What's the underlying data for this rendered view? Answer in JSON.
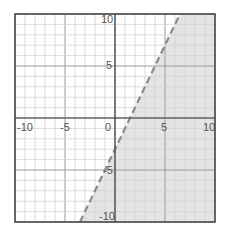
{
  "chart_data": {
    "type": "area",
    "title": "",
    "xlabel": "",
    "ylabel": "",
    "xlim": [
      -10,
      10
    ],
    "ylim": [
      -10,
      10
    ],
    "grid": {
      "minor_step": 1,
      "major_step": 5
    },
    "x_tick_labels": [
      "-10",
      "-5",
      "0",
      "5",
      "10"
    ],
    "y_tick_labels": [
      "10",
      "5",
      "-5",
      "-10"
    ],
    "boundary_line": {
      "equation": "y = 2x - 3",
      "slope": 2,
      "intercept": -3,
      "style": "dashed"
    },
    "shaded_region": "y < 2x - 3",
    "shade_color": "#e4e4e4",
    "line_color": "#8a8a8a"
  },
  "labels": {
    "xm10": "-10",
    "xm5": "-5",
    "x0": "0",
    "x5": "5",
    "x10": "10",
    "y10": "10",
    "y5": "5",
    "ym5": "-5",
    "ym10": "-10"
  }
}
